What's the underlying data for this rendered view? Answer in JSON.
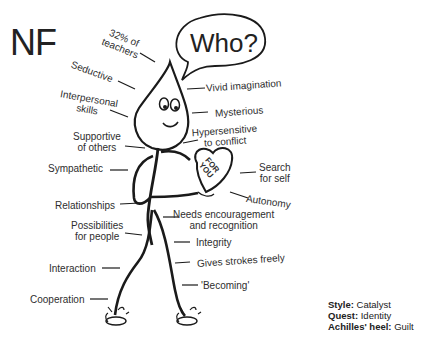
{
  "title": "NF",
  "speech_bubble": "Who?",
  "heart_card": {
    "line1": "FOR",
    "line2": "YOU"
  },
  "labels_left": {
    "teachers_1": "32% of",
    "teachers_2": "teachers",
    "seductive": "Seductive",
    "interpersonal_1": "Interpersonal",
    "interpersonal_2": "skills",
    "supportive_1": "Supportive",
    "supportive_2": "of others",
    "sympathetic": "Sympathetic",
    "relationships": "Relationships",
    "possibilities_1": "Possibilities",
    "possibilities_2": "for people",
    "interaction": "Interaction",
    "cooperation": "Cooperation"
  },
  "labels_right": {
    "vivid": "Vivid imagination",
    "mysterious": "Mysterious",
    "hyper_1": "Hypersensitive",
    "hyper_2": "to conflict",
    "search_1": "Search",
    "search_2": "for self",
    "autonomy": "Autonomy",
    "needs_1": "Needs encouragement",
    "needs_2": "and recognition",
    "integrity": "Integrity",
    "strokes": "Gives strokes freely",
    "becoming": "'Becoming'"
  },
  "info": {
    "style_label": "Style:",
    "style_value": "Catalyst",
    "quest_label": "Quest:",
    "quest_value": "Identity",
    "heel_label": "Achilles' heel:",
    "heel_value": "Guilt"
  }
}
